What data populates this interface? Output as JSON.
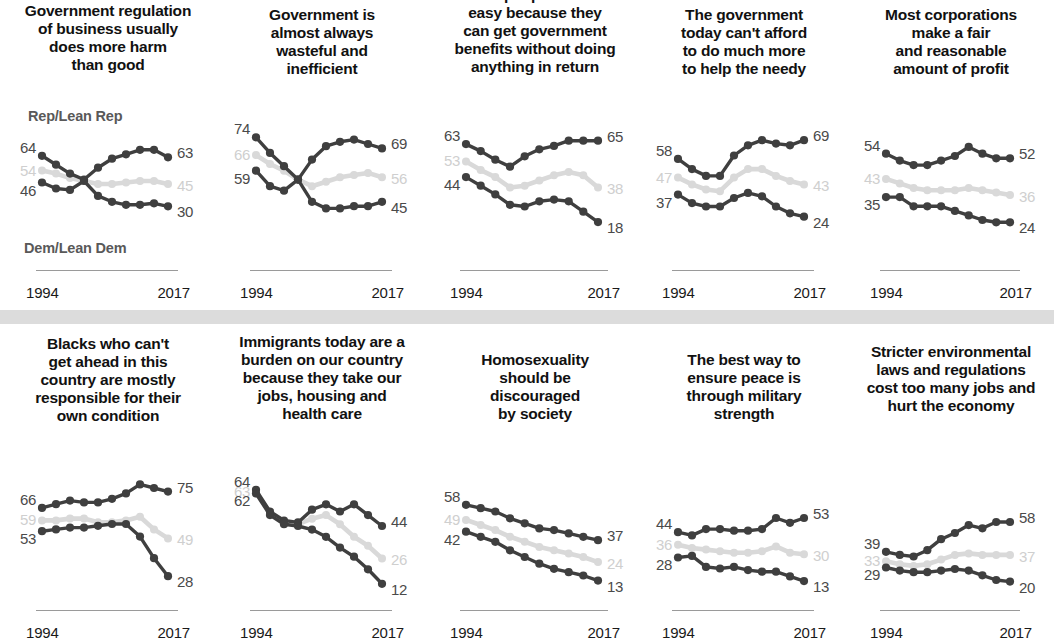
{
  "figure": {
    "series_labels": {
      "rep": "Rep/Lean Rep",
      "dem": "Dem/Lean Dem"
    },
    "axis": {
      "start_year": "1994",
      "end_year": "2017"
    },
    "colors": {
      "rep": "#3f3f3f",
      "dem": "#3f3f3f",
      "total": "#d9d9d9",
      "label_dark": "#4a4a4a",
      "label_light": "#cfcfcf",
      "separator_band": "#dcdcdc",
      "axis_rule": "#9a9a9a",
      "title": "#111111"
    }
  },
  "chart_data": [
    {
      "type": "line",
      "title": "Government regulation\nof business usually\ndoes more harm\nthan good",
      "x": [
        "1994",
        "1999",
        "2002",
        "2004",
        "2009",
        "2011",
        "2014",
        "2015",
        "2016",
        "2017"
      ],
      "xlabel": "",
      "ylabel": "",
      "ylim": [
        10,
        80
      ],
      "grid": false,
      "legend": "inline-endpoint-labels",
      "series": [
        {
          "name": "Rep/Lean Rep",
          "color": "#3f3f3f",
          "values": [
            64,
            58,
            52,
            48,
            56,
            62,
            65,
            68,
            68,
            63
          ],
          "start_label": "64",
          "end_label": "63"
        },
        {
          "name": "Total",
          "color": "#d9d9d9",
          "values": [
            54,
            52,
            49,
            47,
            45,
            45,
            46,
            47,
            47,
            45
          ],
          "start_label": "54",
          "end_label": "45"
        },
        {
          "name": "Dem/Lean Dem",
          "color": "#3f3f3f",
          "values": [
            46,
            42,
            41,
            47,
            37,
            33,
            31,
            31,
            32,
            30
          ],
          "start_label": "46",
          "end_label": "30"
        }
      ]
    },
    {
      "type": "line",
      "title": "Government is\nalmost always\nwasteful and\ninefficient",
      "x": [
        "1994",
        "1999",
        "2002",
        "2004",
        "2009",
        "2011",
        "2014",
        "2015",
        "2016",
        "2017"
      ],
      "xlabel": "",
      "ylabel": "",
      "ylim": [
        35,
        80
      ],
      "grid": false,
      "legend": "inline-endpoint-labels",
      "series": [
        {
          "name": "Rep/Lean Rep",
          "color": "#3f3f3f",
          "values": [
            74,
            67,
            61,
            55,
            64,
            70,
            72,
            73,
            71,
            69
          ],
          "start_label": "74",
          "end_label": "69"
        },
        {
          "name": "Total",
          "color": "#d9d9d9",
          "values": [
            66,
            62,
            59,
            55,
            52,
            54,
            56,
            57,
            58,
            56
          ],
          "start_label": "66",
          "end_label": "56"
        },
        {
          "name": "Dem/Lean Dem",
          "color": "#3f3f3f",
          "values": [
            59,
            52,
            50,
            55,
            45,
            42,
            42,
            43,
            43,
            45
          ],
          "start_label": "59",
          "end_label": "45"
        }
      ]
    },
    {
      "type": "line",
      "title": "Poor people have it\neasy because they\ncan get government\nbenefits without doing\nanything in return",
      "x": [
        "1994",
        "1999",
        "2002",
        "2004",
        "2009",
        "2011",
        "2014",
        "2015",
        "2016",
        "2017"
      ],
      "xlabel": "",
      "ylabel": "",
      "ylim": [
        10,
        70
      ],
      "grid": false,
      "legend": "inline-endpoint-labels",
      "series": [
        {
          "name": "Rep/Lean Rep",
          "color": "#3f3f3f",
          "values": [
            63,
            59,
            54,
            50,
            56,
            60,
            62,
            65,
            65,
            65
          ],
          "start_label": "63",
          "end_label": "65"
        },
        {
          "name": "Total",
          "color": "#d9d9d9",
          "values": [
            53,
            48,
            44,
            38,
            39,
            42,
            45,
            47,
            45,
            38
          ],
          "start_label": "53",
          "end_label": "38"
        },
        {
          "name": "Dem/Lean Dem",
          "color": "#3f3f3f",
          "values": [
            44,
            39,
            34,
            28,
            27,
            30,
            31,
            30,
            24,
            18
          ],
          "start_label": "44",
          "end_label": "18"
        }
      ]
    },
    {
      "type": "line",
      "title": "The government\ntoday can't afford\nto do much more\nto help the needy",
      "x": [
        "1994",
        "1999",
        "2002",
        "2004",
        "2009",
        "2011",
        "2014",
        "2015",
        "2016",
        "2017"
      ],
      "xlabel": "",
      "ylabel": "",
      "ylim": [
        15,
        75
      ],
      "grid": false,
      "legend": "inline-endpoint-labels",
      "series": [
        {
          "name": "Rep/Lean Rep",
          "color": "#3f3f3f",
          "values": [
            58,
            52,
            48,
            48,
            60,
            66,
            69,
            67,
            66,
            69
          ],
          "start_label": "58",
          "end_label": "69"
        },
        {
          "name": "Total",
          "color": "#d9d9d9",
          "values": [
            47,
            43,
            40,
            39,
            47,
            52,
            52,
            48,
            45,
            43
          ],
          "start_label": "47",
          "end_label": "43"
        },
        {
          "name": "Dem/Lean Dem",
          "color": "#3f3f3f",
          "values": [
            37,
            32,
            30,
            30,
            35,
            38,
            36,
            30,
            26,
            24
          ],
          "start_label": "37",
          "end_label": "24"
        }
      ]
    },
    {
      "type": "line",
      "title": "Most corporations\nmake a fair\nand reasonable\namount of profit",
      "x": [
        "1994",
        "1999",
        "2002",
        "2004",
        "2009",
        "2011",
        "2014",
        "2015",
        "2016",
        "2017"
      ],
      "xlabel": "",
      "ylabel": "",
      "ylim": [
        18,
        60
      ],
      "grid": false,
      "legend": "inline-endpoint-labels",
      "series": [
        {
          "name": "Rep/Lean Rep",
          "color": "#3f3f3f",
          "values": [
            54,
            51,
            49,
            49,
            51,
            53,
            57,
            54,
            52,
            52
          ],
          "start_label": "54",
          "end_label": "52"
        },
        {
          "name": "Total",
          "color": "#d9d9d9",
          "values": [
            43,
            41,
            39,
            38,
            38,
            38,
            39,
            38,
            37,
            36
          ],
          "start_label": "43",
          "end_label": "36"
        },
        {
          "name": "Dem/Lean Dem",
          "color": "#3f3f3f",
          "values": [
            35,
            35,
            31,
            31,
            31,
            29,
            27,
            25,
            24,
            24
          ],
          "start_label": "35",
          "end_label": "24"
        }
      ]
    },
    {
      "type": "line",
      "title": "Blacks who can't\nget ahead in this\ncountry are mostly\nresponsible for their\nown condition",
      "x": [
        "1994",
        "1999",
        "2002",
        "2004",
        "2009",
        "2011",
        "2014",
        "2015",
        "2016",
        "2017"
      ],
      "xlabel": "",
      "ylabel": "",
      "ylim": [
        22,
        82
      ],
      "grid": false,
      "legend": "inline-endpoint-labels",
      "series": [
        {
          "name": "Rep/Lean Rep",
          "color": "#3f3f3f",
          "values": [
            66,
            68,
            70,
            69,
            69,
            71,
            74,
            79,
            77,
            75
          ],
          "start_label": "66",
          "end_label": "75"
        },
        {
          "name": "Total",
          "color": "#d9d9d9",
          "values": [
            59,
            59,
            60,
            60,
            58,
            58,
            59,
            61,
            54,
            49
          ],
          "start_label": "59",
          "end_label": "49"
        },
        {
          "name": "Dem/Lean Dem",
          "color": "#3f3f3f",
          "values": [
            53,
            54,
            55,
            55,
            56,
            57,
            57,
            50,
            38,
            28
          ],
          "start_label": "53",
          "end_label": "28"
        }
      ]
    },
    {
      "type": "line",
      "title": "Immigrants today are a\nburden on our country\nbecause they take our\njobs, housing and\nhealth care",
      "x": [
        "1994",
        "1999",
        "2002",
        "2004",
        "2009",
        "2011",
        "2014",
        "2015",
        "2016",
        "2017"
      ],
      "xlabel": "",
      "ylabel": "",
      "ylim": [
        8,
        70
      ],
      "grid": false,
      "legend": "inline-endpoint-labels",
      "series": [
        {
          "name": "Rep/Lean Rep",
          "color": "#3f3f3f",
          "values": [
            64,
            52,
            47,
            46,
            53,
            56,
            52,
            56,
            50,
            44
          ],
          "start_label": "64",
          "end_label": "44"
        },
        {
          "name": "Total",
          "color": "#d9d9d9",
          "values": [
            63,
            51,
            46,
            45,
            48,
            50,
            45,
            38,
            33,
            26
          ],
          "start_label": "63",
          "end_label": "26"
        },
        {
          "name": "Dem/Lean Dem",
          "color": "#3f3f3f",
          "values": [
            62,
            50,
            45,
            44,
            42,
            38,
            32,
            27,
            20,
            12
          ],
          "start_label": "62",
          "end_label": "12"
        }
      ]
    },
    {
      "type": "line",
      "title": "Homosexuality\nshould be\ndiscouraged\nby society",
      "x": [
        "1994",
        "1999",
        "2002",
        "2004",
        "2009",
        "2011",
        "2014",
        "2015",
        "2016",
        "2017"
      ],
      "xlabel": "",
      "ylabel": "",
      "ylim": [
        8,
        65
      ],
      "grid": false,
      "legend": "inline-endpoint-labels",
      "series": [
        {
          "name": "Rep/Lean Rep",
          "color": "#3f3f3f",
          "values": [
            58,
            56,
            54,
            50,
            47,
            44,
            43,
            41,
            39,
            37
          ],
          "start_label": "58",
          "end_label": "37"
        },
        {
          "name": "Total",
          "color": "#d9d9d9",
          "values": [
            49,
            46,
            43,
            39,
            36,
            33,
            31,
            29,
            27,
            24
          ],
          "start_label": "49",
          "end_label": "24"
        },
        {
          "name": "Dem/Lean Dem",
          "color": "#3f3f3f",
          "values": [
            42,
            39,
            36,
            31,
            27,
            23,
            20,
            18,
            16,
            13
          ],
          "start_label": "42",
          "end_label": "13"
        }
      ]
    },
    {
      "type": "line",
      "title": "The best way to\nensure peace is\nthrough military\nstrength",
      "x": [
        "1994",
        "1999",
        "2002",
        "2004",
        "2009",
        "2011",
        "2014",
        "2015",
        "2016",
        "2017"
      ],
      "xlabel": "",
      "ylabel": "",
      "ylim": [
        8,
        60
      ],
      "grid": false,
      "legend": "inline-endpoint-labels",
      "series": [
        {
          "name": "Rep/Lean Rep",
          "color": "#3f3f3f",
          "values": [
            44,
            42,
            46,
            46,
            45,
            45,
            46,
            53,
            50,
            53
          ],
          "start_label": "44",
          "end_label": "53"
        },
        {
          "name": "Total",
          "color": "#d9d9d9",
          "values": [
            36,
            34,
            33,
            32,
            31,
            31,
            32,
            35,
            31,
            30
          ],
          "start_label": "36",
          "end_label": "30"
        },
        {
          "name": "Dem/Lean Dem",
          "color": "#3f3f3f",
          "values": [
            28,
            29,
            22,
            21,
            22,
            20,
            19,
            19,
            16,
            13
          ],
          "start_label": "28",
          "end_label": "13"
        }
      ]
    },
    {
      "type": "line",
      "title": "Stricter environmental\nlaws and regulations\ncost too many jobs and\nhurt the economy",
      "x": [
        "1994",
        "1999",
        "2002",
        "2004",
        "2009",
        "2011",
        "2014",
        "2015",
        "2016",
        "2017"
      ],
      "xlabel": "",
      "ylabel": "",
      "ylim": [
        14,
        65
      ],
      "grid": false,
      "legend": "inline-endpoint-labels",
      "series": [
        {
          "name": "Rep/Lean Rep",
          "color": "#3f3f3f",
          "values": [
            39,
            37,
            36,
            40,
            47,
            51,
            56,
            54,
            58,
            58
          ],
          "start_label": "39",
          "end_label": "58"
        },
        {
          "name": "Total",
          "color": "#d9d9d9",
          "values": [
            33,
            31,
            30,
            31,
            34,
            37,
            38,
            37,
            37,
            37
          ],
          "start_label": "33",
          "end_label": "37"
        },
        {
          "name": "Dem/Lean Dem",
          "color": "#3f3f3f",
          "values": [
            29,
            27,
            26,
            26,
            27,
            28,
            27,
            24,
            21,
            20
          ],
          "start_label": "29",
          "end_label": "20"
        }
      ]
    }
  ]
}
